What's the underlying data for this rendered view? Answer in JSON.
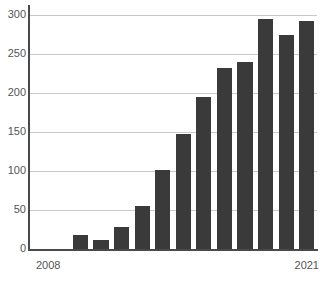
{
  "chart_data": {
    "type": "bar",
    "title": "",
    "xlabel": "",
    "ylabel": "",
    "categories": [
      "2008",
      "2009",
      "2010",
      "2011",
      "2012",
      "2013",
      "2014",
      "2015",
      "2016",
      "2017",
      "2018",
      "2019",
      "2020",
      "2021"
    ],
    "values": [
      0,
      0,
      18,
      11,
      28,
      55,
      101,
      147,
      195,
      232,
      240,
      295,
      274,
      292
    ],
    "ylim": [
      0,
      300
    ],
    "ytick_values": [
      0,
      50,
      100,
      150,
      200,
      250,
      300
    ],
    "ytick_labels": [
      "0",
      "50",
      "100",
      "150",
      "200",
      "250",
      "300"
    ],
    "xtick_labels_visible": [
      "2008",
      "2021"
    ],
    "grid": true,
    "legend": null,
    "bar_color": "#3a3a3a",
    "gridline_color": "#c9c9c9",
    "axis_color": "#4a4a4a",
    "background_color": "#ffffff"
  },
  "axis": {
    "x_first_label": "2008",
    "x_last_label": "2021"
  },
  "watermark": {
    "text": ""
  }
}
